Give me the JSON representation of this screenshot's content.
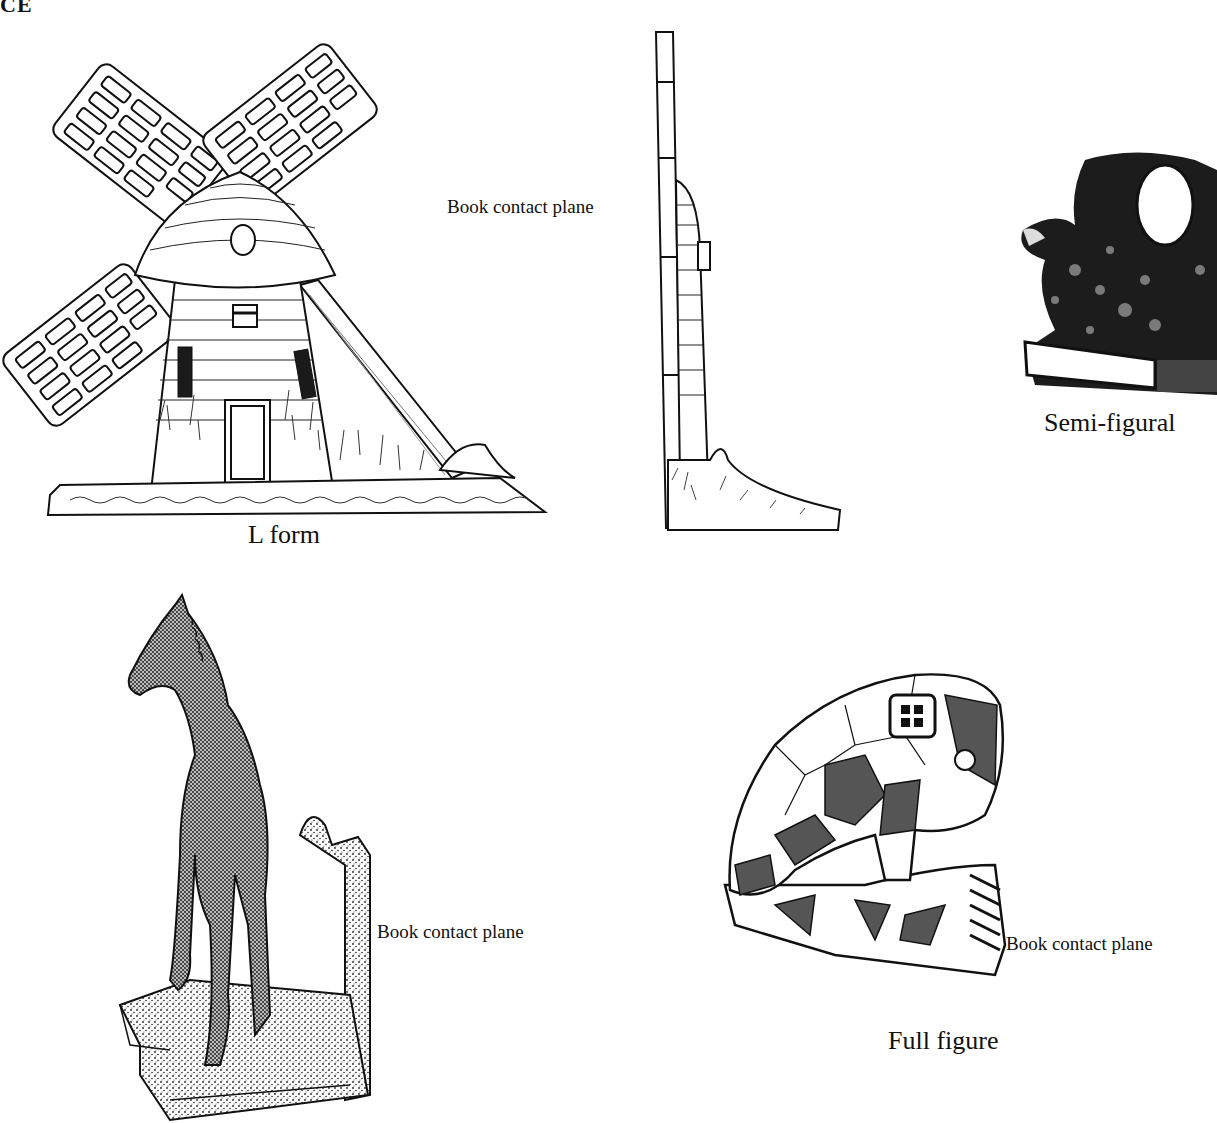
{
  "page": {
    "header_fragment": "CE"
  },
  "figures": {
    "l_form": {
      "caption": "L form",
      "subject": "windmill bookend (front view)"
    },
    "l_form_side": {
      "label": "Book contact plane",
      "subject": "windmill bookend (side profile)"
    },
    "semi_figural": {
      "caption": "Semi-figural",
      "subject": "animal figure bookend photograph"
    },
    "horse": {
      "label": "Book contact plane",
      "subject": "stippled horse bookend"
    },
    "full_figure": {
      "caption": "Full figure",
      "label": "Book contact plane",
      "subject": "faceted elephant bookend"
    }
  },
  "colors": {
    "ink": "#111111",
    "background": "#ffffff",
    "shade": "#555555"
  }
}
